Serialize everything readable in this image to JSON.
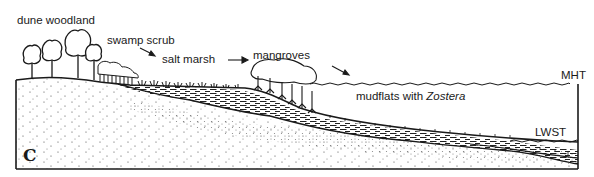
{
  "diagram": {
    "panel_label": "C",
    "zones": [
      {
        "id": "dune-woodland",
        "label": "dune woodland"
      },
      {
        "id": "swamp-scrub",
        "label": "swamp scrub"
      },
      {
        "id": "salt-marsh",
        "label": "salt marsh"
      },
      {
        "id": "mangroves",
        "label": "mangroves"
      },
      {
        "id": "mudflats",
        "label_prefix": "mudflats with ",
        "label_italic": "Zostera"
      }
    ],
    "tide_levels": {
      "high": "MHT",
      "low": "LWST"
    },
    "arrows": [
      {
        "from": "swamp scrub",
        "to": "salt marsh"
      },
      {
        "from": "salt marsh",
        "to": "mangroves"
      },
      {
        "from": "mangroves",
        "to": "mudflats"
      }
    ],
    "colors": {
      "ink": "#1a1a1a",
      "background": "#ffffff"
    }
  }
}
